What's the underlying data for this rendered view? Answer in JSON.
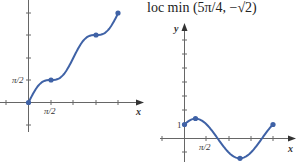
{
  "figure": {
    "annotation": "loc min (5π/4, −√2)",
    "colors": {
      "curve": "#3f62a6",
      "axis": "#555555",
      "points": "#3f62a6"
    }
  },
  "chart_data": [
    {
      "type": "line",
      "title": "",
      "function": "y = x + sin(2x)/2",
      "xlabel": "x",
      "ylabel": "",
      "x_tick_labels": [
        "π/2"
      ],
      "y_tick_labels": [
        "π/2"
      ],
      "xlim": [
        -0.6,
        7.0
      ],
      "ylim": [
        -1.6,
        6.7
      ],
      "grid": false,
      "points": [
        {
          "x": 0,
          "y": 0
        },
        {
          "x": 1.5708,
          "y": 1.5708
        },
        {
          "x": 4.7124,
          "y": 4.7124
        },
        {
          "x": 6.2832,
          "y": 6.2832
        }
      ],
      "labels": {
        "x_axis": "x",
        "x_tick": "π/2",
        "y_tick": "π/2"
      }
    },
    {
      "type": "line",
      "title": "loc min (5π/4, −√2)",
      "function": "y = sin x + cos x",
      "xlabel": "x",
      "ylabel": "y",
      "x_tick_labels": [
        "π/2"
      ],
      "y_tick_labels": [
        "1"
      ],
      "xlim": [
        -0.7,
        7.2
      ],
      "ylim": [
        -1.7,
        8.5
      ],
      "grid": false,
      "points": [
        {
          "x": 0,
          "y": 1
        },
        {
          "x": 0.7854,
          "y": 1.4142
        },
        {
          "x": 3.927,
          "y": -1.4142
        },
        {
          "x": 6.2832,
          "y": 1
        }
      ],
      "labels": {
        "x_axis": "x",
        "y_axis": "y",
        "x_tick": "π/2",
        "y_tick": "1"
      }
    }
  ]
}
